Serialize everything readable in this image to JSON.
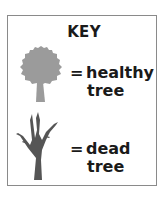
{
  "legend": {
    "title": "KEY",
    "items": [
      {
        "icon": "healthy-tree-icon",
        "symbol": "=",
        "line1": "healthy",
        "line2": "tree",
        "color": "#9b9b9b"
      },
      {
        "icon": "dead-tree-icon",
        "symbol": "=",
        "line1": "dead",
        "line2": "tree",
        "color": "#555555"
      }
    ]
  },
  "colors": {
    "border": "#8a8a8a",
    "text": "#1a1a1a",
    "healthy_tree": "#9b9b9b",
    "dead_tree": "#555555"
  }
}
